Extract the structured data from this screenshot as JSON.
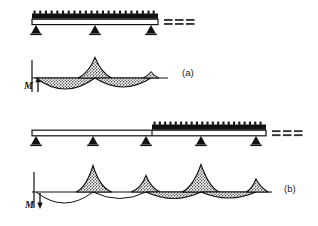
{
  "figure": {
    "type": "engineering-diagram",
    "background_color": "#ffffff",
    "ink_color": "#111111",
    "shading_color": "#4a4a4a",
    "width": 318,
    "height": 226
  },
  "panels": [
    {
      "id": "a",
      "caption": "(a)",
      "caption_x": 182,
      "caption_y": 76,
      "moment_axis_label": "M",
      "moment_axis_label_x": 25,
      "moment_axis_label_y": 88,
      "moment_arrow_direction": "up",
      "beam": {
        "x_start": 32,
        "x_end": 158,
        "y": 25,
        "continuation_marker": "===",
        "continuation_x": 163,
        "continuation_y": 25,
        "load_type": "uniformly-distributed",
        "load_label": "w",
        "loaded_from": 32,
        "loaded_to": 158,
        "load_hatch_count": 22,
        "supports": [
          {
            "x": 36,
            "type": "pinned"
          },
          {
            "x": 95,
            "type": "pinned"
          },
          {
            "x": 151,
            "type": "pinned"
          }
        ]
      },
      "moment_diagram": {
        "baseline_y": 78,
        "x_start": 32,
        "x_end": 168,
        "axis_x": 32,
        "axis_top_y": 60,
        "axis_bottom_y": 95,
        "sign_convention": "sagging below axis, hogging above axis",
        "segments": [
          {
            "name": "span-1-sagging",
            "x0": 36,
            "x1": 95,
            "peak_x": 65,
            "amplitude": -11,
            "side": "below"
          },
          {
            "name": "support-2-hogging",
            "x0": 78,
            "x1": 112,
            "peak_x": 95,
            "amplitude": 19,
            "side": "above"
          },
          {
            "name": "span-2-sagging",
            "x0": 95,
            "x1": 151,
            "peak_x": 123,
            "amplitude": -9,
            "side": "below"
          },
          {
            "name": "support-3-hogging",
            "x0": 143,
            "x1": 158,
            "peak_x": 151,
            "amplitude": 6,
            "side": "above"
          }
        ]
      }
    },
    {
      "id": "b",
      "caption": "(b)",
      "caption_x": 284,
      "caption_y": 192,
      "moment_axis_label": "M",
      "moment_axis_label_x": 25,
      "moment_axis_label_y": 207,
      "moment_arrow_direction": "down",
      "beam": {
        "x_start": 32,
        "x_end": 266,
        "y": 136,
        "continuation_marker": "===",
        "continuation_x": 272,
        "continuation_y": 136,
        "load_type": "uniformly-distributed-partial",
        "load_label": "w",
        "loaded_from": 152,
        "loaded_to": 266,
        "load_hatch_count": 21,
        "supports": [
          {
            "x": 36,
            "type": "pinned"
          },
          {
            "x": 93,
            "type": "pinned"
          },
          {
            "x": 146,
            "type": "pinned"
          },
          {
            "x": 201,
            "type": "pinned"
          },
          {
            "x": 256,
            "type": "pinned"
          }
        ]
      },
      "moment_diagram": {
        "baseline_y": 192,
        "x_start": 32,
        "x_end": 272,
        "axis_x": 34,
        "axis_top_y": 172,
        "axis_bottom_y": 212,
        "sign_convention": "sagging below axis, hogging above axis",
        "segments": [
          {
            "name": "span-1-sagging",
            "x0": 36,
            "x1": 93,
            "peak_x": 64,
            "amplitude": -15,
            "side": "below"
          },
          {
            "name": "support-2-hogging",
            "x0": 76,
            "x1": 112,
            "peak_x": 93,
            "amplitude": 27,
            "side": "above"
          },
          {
            "name": "span-2-sagging",
            "x0": 93,
            "x1": 146,
            "peak_x": 120,
            "amplitude": -9,
            "side": "below"
          },
          {
            "name": "support-3-hogging",
            "x0": 131,
            "x1": 160,
            "peak_x": 146,
            "amplitude": 17,
            "side": "above"
          },
          {
            "name": "span-3-sagging",
            "x0": 146,
            "x1": 201,
            "peak_x": 174,
            "amplitude": -12,
            "side": "below"
          },
          {
            "name": "support-4-hogging",
            "x0": 182,
            "x1": 219,
            "peak_x": 201,
            "amplitude": 28,
            "side": "above"
          },
          {
            "name": "span-4-sagging",
            "x0": 201,
            "x1": 256,
            "peak_x": 229,
            "amplitude": -11,
            "side": "below"
          },
          {
            "name": "support-5-hogging",
            "x0": 246,
            "x1": 268,
            "peak_x": 256,
            "amplitude": 13,
            "side": "above"
          }
        ]
      }
    }
  ]
}
